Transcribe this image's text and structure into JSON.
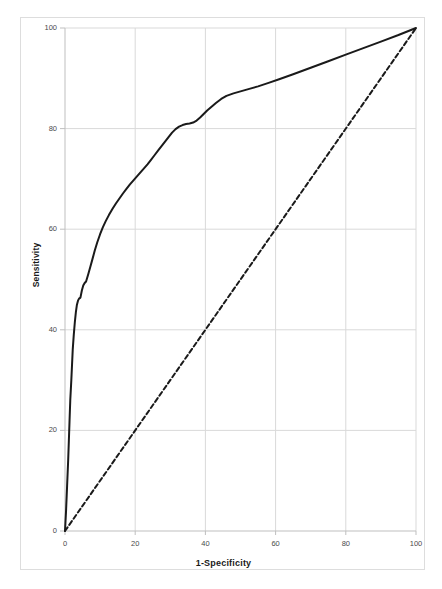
{
  "page": {
    "header_fragment": "",
    "background": "#ffffff"
  },
  "figure": {
    "border_color": "#dddddd",
    "plot_background": "#ffffff"
  },
  "chart_data": {
    "type": "line",
    "title": "",
    "subtitle": "",
    "xlabel": "1-Specificity",
    "ylabel": "Sensitivity",
    "xlim": [
      0,
      100
    ],
    "ylim": [
      0,
      100
    ],
    "xticks": [
      0,
      20,
      40,
      60,
      80,
      100
    ],
    "yticks": [
      0,
      20,
      40,
      60,
      80,
      100
    ],
    "xticklabels": [
      "0",
      "20",
      "40",
      "60",
      "80",
      "100"
    ],
    "yticklabels": [
      "0",
      "20",
      "40",
      "60",
      "80",
      "100"
    ],
    "grid": true,
    "grid_color": "#d9d9d9",
    "legend": false,
    "legend_position": "none",
    "annotations": [],
    "series": [
      {
        "name": "ROC curve",
        "style": "solid",
        "color": "#1a1a1a",
        "width": 2.0,
        "x": [
          0,
          0.3,
          0.6,
          0.9,
          1.1,
          1.3,
          1.5,
          1.8,
          2.0,
          2.2,
          2.5,
          2.8,
          3.1,
          3.4,
          3.7,
          4.0,
          4.4,
          4.8,
          5.2,
          5.6,
          6.0,
          6.6,
          7.2,
          7.8,
          8.5,
          9.2,
          10.0,
          10.8,
          11.6,
          12.5,
          13.5,
          14.5,
          15.5,
          16.5,
          17.5,
          18.5,
          19.5,
          20.5,
          21.5,
          22.5,
          23.5,
          24.5,
          25.5,
          26.5,
          27.5,
          28.5,
          29.5,
          30.5,
          31.5,
          32.5,
          33.5,
          34.5,
          35.5,
          36.5,
          37.5,
          38.5,
          39.5,
          40.5,
          41.5,
          43.0,
          44.5,
          46.0,
          48.0,
          50.0,
          52.5,
          55.0,
          58.0,
          61.0,
          65.0,
          70.0,
          75.0,
          80.0,
          85.0,
          90.0,
          95.0,
          100.0
        ],
        "y": [
          0,
          4,
          9,
          14,
          18,
          22,
          26,
          30,
          33,
          36,
          39,
          41.5,
          43.5,
          45,
          45.8,
          46.2,
          46.4,
          47.8,
          48.8,
          49.3,
          49.6,
          51.0,
          52.5,
          54.0,
          55.8,
          57.4,
          59.0,
          60.4,
          61.6,
          62.8,
          64.0,
          65.1,
          66.1,
          67.1,
          68.0,
          68.9,
          69.7,
          70.5,
          71.3,
          72.1,
          72.9,
          73.8,
          74.7,
          75.6,
          76.5,
          77.4,
          78.3,
          79.2,
          79.9,
          80.4,
          80.7,
          80.9,
          81.0,
          81.2,
          81.6,
          82.2,
          82.9,
          83.6,
          84.2,
          85.1,
          85.9,
          86.5,
          87.0,
          87.4,
          87.9,
          88.4,
          89.1,
          89.8,
          90.8,
          92.1,
          93.4,
          94.7,
          96.0,
          97.3,
          98.6,
          100.0
        ]
      },
      {
        "name": "Reference line",
        "style": "dashed",
        "color": "#1a1a1a",
        "width": 2.0,
        "x": [
          0,
          100
        ],
        "y": [
          0,
          100
        ]
      }
    ]
  }
}
